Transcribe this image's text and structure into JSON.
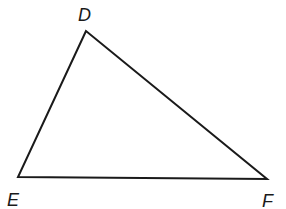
{
  "diagram": {
    "type": "triangle",
    "stroke_color": "#1a1a1a",
    "background": "#ffffff",
    "vertices": [
      {
        "name": "D",
        "x": 86,
        "y": 31,
        "label_x": 78,
        "label_y": 21
      },
      {
        "name": "E",
        "x": 18,
        "y": 177,
        "label_x": 7,
        "label_y": 206
      },
      {
        "name": "F",
        "x": 267,
        "y": 179,
        "label_x": 262,
        "label_y": 207
      }
    ],
    "edges": [
      {
        "name": "DE",
        "from": "D",
        "to": "E"
      },
      {
        "name": "EF",
        "from": "E",
        "to": "F"
      },
      {
        "name": "FD",
        "from": "F",
        "to": "D"
      }
    ]
  }
}
